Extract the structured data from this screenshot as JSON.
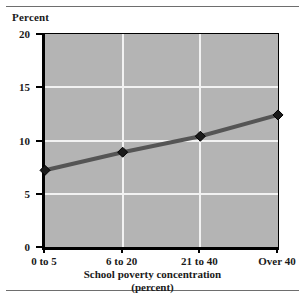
{
  "figure": {
    "rule_color": "#6e6e6e"
  },
  "chart_data": {
    "type": "line",
    "title": "",
    "subtitle": "",
    "categories": [
      "0 to 5",
      "6 to 20",
      "21 to 40",
      "Over 40"
    ],
    "values": [
      7.2,
      8.9,
      10.4,
      12.4
    ],
    "series": [
      {
        "name": "Percent",
        "values": [
          7.2,
          8.9,
          10.4,
          12.4
        ]
      }
    ],
    "xlabel": "School poverty concentration",
    "xlabel_line2": "(percent)",
    "ylabel": "Percent",
    "ylim": [
      0,
      20
    ],
    "yticks": [
      0,
      5,
      10,
      15,
      20
    ],
    "ytick_labels": [
      "0",
      "5",
      "10",
      "15",
      "20"
    ],
    "grid": "both",
    "legend": "none",
    "marker": "diamond",
    "plot_bg_color": "#b4b4b4",
    "gridline_color": "#f2f2f2",
    "line_color": "#555555",
    "marker_color": "#1a1a1a",
    "axis_color": "#000000"
  }
}
